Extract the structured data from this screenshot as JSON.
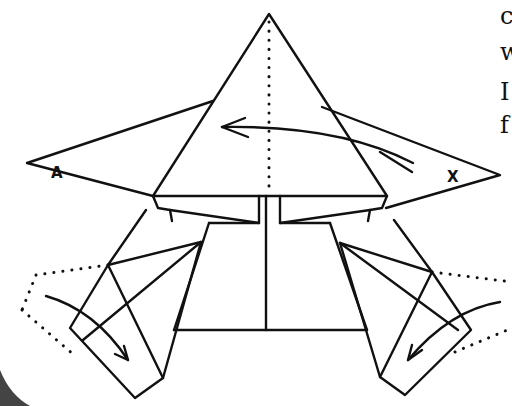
{
  "diagram": {
    "type": "origami-fold-instruction",
    "labels": {
      "left_flap": "A",
      "right_flap": "X"
    },
    "edge_text_fragments": [
      "c",
      "w",
      "I",
      "f"
    ],
    "colors": {
      "ink": "#111111",
      "paper": "#ffffff",
      "corner_shadow": "#444444"
    },
    "elements": [
      "top-triangle-flap",
      "center-dotted-fold-line",
      "left-wing-flap",
      "right-wing-flap",
      "left-leg",
      "right-leg",
      "center-body",
      "left-arrow-swing-fold",
      "right-arrow-swing-fold",
      "top-arrow-fold-left"
    ]
  }
}
